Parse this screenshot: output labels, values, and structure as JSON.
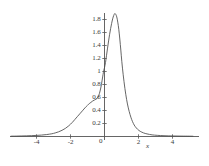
{
  "chart_data": {
    "type": "line",
    "title": "",
    "subtitle": "",
    "xlabel": "x",
    "ylabel": "",
    "xlim": [
      -5.5,
      5.2
    ],
    "ylim": [
      0,
      2.0
    ],
    "grid": false,
    "legend": null,
    "axis_color": "#555555",
    "line_color": "#4a4a4a",
    "background": "#ffffff",
    "x_ticks": [
      -4,
      -2,
      0,
      2,
      4
    ],
    "x_tick_labels": [
      "-4",
      "-2",
      "0",
      "2",
      "4"
    ],
    "y_ticks": [
      0.2,
      0.4,
      0.6,
      0.8,
      1.0,
      1.2,
      1.4,
      1.6,
      1.8
    ],
    "y_tick_labels": [
      "0.2",
      "0.4",
      "0.6",
      "0.8",
      "1",
      "1.2",
      "1.4",
      "1.6",
      "1.8"
    ],
    "origin_label": "0",
    "series": [
      {
        "name": "density",
        "x": [
          -5.5,
          -5.2,
          -4.9,
          -4.6,
          -4.3,
          -4.0,
          -3.7,
          -3.4,
          -3.1,
          -2.9,
          -2.7,
          -2.5,
          -2.3,
          -2.1,
          -1.9,
          -1.75,
          -1.6,
          -1.45,
          -1.3,
          -1.15,
          -1.0,
          -0.9,
          -0.8,
          -0.7,
          -0.6,
          -0.5,
          -0.42,
          -0.34,
          -0.26,
          -0.18,
          -0.1,
          -0.04,
          0.0,
          0.06,
          0.12,
          0.18,
          0.24,
          0.3,
          0.36,
          0.42,
          0.48,
          0.54,
          0.6,
          0.66,
          0.72,
          0.78,
          0.84,
          0.9,
          0.96,
          1.02,
          1.1,
          1.2,
          1.3,
          1.4,
          1.5,
          1.6,
          1.7,
          1.8,
          1.95,
          2.1,
          2.3,
          2.5,
          2.8,
          3.1,
          3.5,
          4.0,
          4.5,
          5.0,
          5.2
        ],
        "y": [
          0.005,
          0.006,
          0.008,
          0.01,
          0.013,
          0.017,
          0.022,
          0.03,
          0.042,
          0.055,
          0.072,
          0.095,
          0.125,
          0.165,
          0.215,
          0.26,
          0.305,
          0.35,
          0.395,
          0.44,
          0.48,
          0.505,
          0.525,
          0.545,
          0.56,
          0.575,
          0.59,
          0.63,
          0.7,
          0.8,
          0.93,
          1.02,
          1.06,
          1.14,
          1.25,
          1.36,
          1.47,
          1.57,
          1.66,
          1.74,
          1.81,
          1.86,
          1.89,
          1.88,
          1.84,
          1.76,
          1.65,
          1.5,
          1.33,
          1.15,
          0.95,
          0.74,
          0.57,
          0.44,
          0.34,
          0.26,
          0.2,
          0.155,
          0.11,
          0.08,
          0.055,
          0.04,
          0.025,
          0.018,
          0.012,
          0.008,
          0.006,
          0.005,
          0.004
        ]
      }
    ],
    "annotations": {
      "peak_x": 0.6,
      "peak_y": 1.89,
      "shoulder_x": -0.45,
      "shoulder_y": 0.58,
      "y_axis_crossing": 1.06
    }
  }
}
